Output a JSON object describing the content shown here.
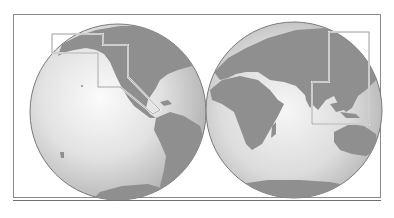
{
  "map": {
    "type": "double-hemisphere world map",
    "hemispheres": [
      {
        "id": "western",
        "label": "Western Hemisphere",
        "regions": [
          "North America",
          "South America",
          "Antarctica"
        ]
      },
      {
        "id": "eastern",
        "label": "Eastern Hemisphere",
        "regions": [
          "Europe",
          "Asia",
          "Africa",
          "Australia",
          "Antarctica"
        ]
      }
    ],
    "insets": [
      {
        "id": "americas-pacific-coast",
        "label": "Alaska – West Coast – Central America highlight"
      },
      {
        "id": "east-southeast-asia",
        "label": "East & Southeast Asia highlight"
      }
    ],
    "colors": {
      "ocean_light": "#f4f4f4",
      "ocean_dark": "#b9b9b9",
      "land": "#8f8f8f",
      "globe_edge": "#7a7a7a",
      "frame": "#8a8a8a",
      "inset_outline": "#a8a8a8"
    }
  },
  "header": {
    "title": ""
  }
}
